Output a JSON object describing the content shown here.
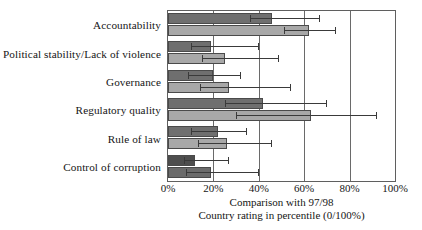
{
  "chart_data": {
    "type": "bar",
    "orientation": "horizontal",
    "title": "",
    "xlabel": "Comparison with 97/98",
    "xlabel_line2": "Country rating in percentile (0/100%)",
    "ylabel": "",
    "xlim": [
      0,
      100
    ],
    "xticks": [
      0,
      20,
      40,
      60,
      80,
      100
    ],
    "xtick_labels": [
      "0%",
      "20%",
      "40%",
      "60%",
      "80%",
      "100%"
    ],
    "grid": true,
    "grid_axis": "x",
    "legend": "none",
    "categories": [
      "Accountability",
      "Political stability/Lack of violence",
      "Governance",
      "Regulatory quality",
      "Rule of law",
      "Control of corruption"
    ],
    "series": [
      {
        "name": "Series 1",
        "color": "#6f6f6f",
        "values": [
          46,
          19,
          20,
          42,
          22,
          12
        ],
        "err_low": [
          36,
          10,
          9,
          25,
          10,
          7
        ],
        "err_high": [
          67,
          40,
          32,
          70,
          35,
          27
        ]
      },
      {
        "name": "Series 2",
        "color": "#a8a8a8",
        "values": [
          62,
          25,
          27,
          63,
          26,
          19
        ],
        "err_low": [
          51,
          15,
          14,
          30,
          13,
          8
        ],
        "err_high": [
          74,
          49,
          54,
          92,
          46,
          40
        ]
      }
    ]
  },
  "axis": {
    "tick_0": "0%",
    "tick_1": "20%",
    "tick_2": "40%",
    "tick_3": "60%",
    "tick_4": "80%",
    "tick_5": "100%"
  },
  "caption": {
    "line1": "Comparison with 97/98",
    "line2": "Country rating in percentile (0/100%)"
  },
  "colors": {
    "series1": "#6f6f6f",
    "series2": "#a8a8a8",
    "frame": "#5f5f5f",
    "grid": "#6a6a6a",
    "error": "#3a3a3a",
    "background": "#ffffff"
  }
}
